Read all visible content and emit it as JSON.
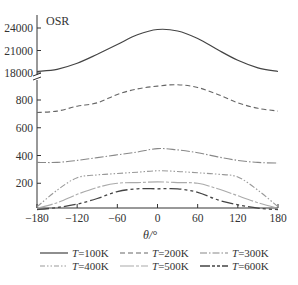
{
  "chart_data": {
    "type": "line",
    "title": "",
    "ylabel": "OSR",
    "xlabel": "θ/°",
    "x_ticks": [
      -180,
      -120,
      -60,
      0,
      60,
      120,
      180
    ],
    "y_ticks_upper": [
      18000,
      21000,
      24000
    ],
    "y_ticks_lower": [
      200,
      400,
      600,
      800
    ],
    "xlim": [
      -180,
      180
    ],
    "ylim_lower": [
      0,
      930
    ],
    "ylim_upper": [
      18000,
      25000
    ],
    "broken_axis": true,
    "grid": false,
    "legend_position": "bottom",
    "x": [
      -180,
      -150,
      -120,
      -90,
      -60,
      -30,
      0,
      30,
      60,
      90,
      120,
      150,
      180
    ],
    "series": [
      {
        "name": "T=100K",
        "style": "solid",
        "values": [
          18200,
          18500,
          19300,
          20500,
          21800,
          23100,
          23800,
          23600,
          22600,
          21100,
          19700,
          18700,
          18200
        ]
      },
      {
        "name": "T=200K",
        "style": "dashed",
        "values": [
          710,
          720,
          755,
          780,
          840,
          880,
          900,
          910,
          890,
          840,
          780,
          740,
          720
        ]
      },
      {
        "name": "T=300K",
        "style": "dash-dot",
        "values": [
          350,
          350,
          365,
          385,
          405,
          425,
          450,
          440,
          420,
          390,
          365,
          350,
          345
        ]
      },
      {
        "name": "T=400K",
        "style": "dash-dot-dot",
        "values": [
          30,
          150,
          240,
          260,
          270,
          280,
          290,
          285,
          275,
          265,
          245,
          150,
          30
        ]
      },
      {
        "name": "T=500K",
        "style": "long-dash-short",
        "values": [
          20,
          60,
          120,
          170,
          200,
          205,
          210,
          205,
          200,
          160,
          110,
          60,
          20
        ]
      },
      {
        "name": "T=600K",
        "style": "long-dash-double-short",
        "values": [
          10,
          25,
          50,
          90,
          140,
          160,
          160,
          160,
          135,
          80,
          45,
          20,
          10
        ]
      }
    ]
  },
  "labels": {
    "ylabel": "OSR",
    "xlabel": "θ/°"
  },
  "legend": [
    {
      "label": "T=100K",
      "T": "T",
      "rest": "=100K"
    },
    {
      "label": "T=200K",
      "T": "T",
      "rest": "=200K"
    },
    {
      "label": "T=300K",
      "T": "T",
      "rest": "=300K"
    },
    {
      "label": "T=400K",
      "T": "T",
      "rest": "=400K"
    },
    {
      "label": "T=500K",
      "T": "T",
      "rest": "=500K"
    },
    {
      "label": "T=600K",
      "T": "T",
      "rest": "=600K"
    }
  ]
}
